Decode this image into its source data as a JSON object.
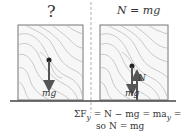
{
  "left_panel": {
    "title": "?",
    "force_label": "mg"
  },
  "right_panel": {
    "title": "N = mg",
    "force_down_label": "mg",
    "force_up_label": "N"
  },
  "equation": {
    "line1_sigma": "ΣF",
    "line1_sub": "y",
    "line1_rest": " = N − mg = ma",
    "line1_sub2": "y",
    "line1_end": " = 0",
    "line2": "so N = mg"
  },
  "colors": {
    "box_stroke": "#777777",
    "grain": "#b5b5b5",
    "arrow": "#555555",
    "ground": "#444444",
    "divider": "#999999"
  }
}
